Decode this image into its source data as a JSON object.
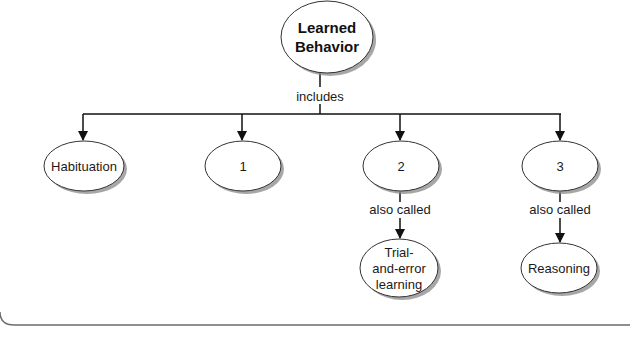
{
  "diagram": {
    "type": "concept-map",
    "root": {
      "id": "root",
      "lines": [
        "Learned",
        "Behavior"
      ]
    },
    "root_edge_label": "includes",
    "children": [
      {
        "id": "habituation",
        "lines": [
          "Habituation"
        ]
      },
      {
        "id": "n1",
        "lines": [
          "1"
        ]
      },
      {
        "id": "n2",
        "lines": [
          "2"
        ],
        "edge_label": "also called",
        "child": {
          "id": "trial",
          "lines": [
            "Trial-",
            "and-error",
            "learning"
          ]
        }
      },
      {
        "id": "n3",
        "lines": [
          "3"
        ],
        "edge_label": "also called",
        "child": {
          "id": "reasoning",
          "lines": [
            "Reasoning"
          ]
        }
      }
    ],
    "colors": {
      "outline": "#333333",
      "shadow": "#8a8a8a",
      "line": "#111111",
      "border": "#6b6b6b"
    }
  }
}
